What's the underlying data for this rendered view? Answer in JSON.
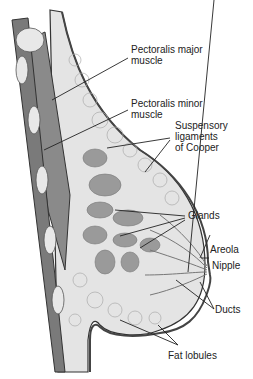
{
  "figure": {
    "colors": {
      "muscle": "#8a8a8a",
      "gland": "#9a9a9a",
      "fat": "#dcdcdc",
      "outline": "#333333",
      "skin": "#555555"
    },
    "labels": [
      {
        "id": "pectoralis-major",
        "lines": [
          "Pectoralis major",
          "muscle"
        ]
      },
      {
        "id": "pectoralis-minor",
        "lines": [
          "Pectoralis minor",
          "muscle"
        ]
      },
      {
        "id": "suspensory-ligaments",
        "lines": [
          "Suspensory",
          "ligaments",
          "of Cooper"
        ]
      },
      {
        "id": "glands",
        "lines": [
          "Glands"
        ]
      },
      {
        "id": "areola",
        "lines": [
          "Areola"
        ]
      },
      {
        "id": "nipple",
        "lines": [
          "Nipple"
        ]
      },
      {
        "id": "ducts",
        "lines": [
          "Ducts"
        ]
      },
      {
        "id": "fat-lobules",
        "lines": [
          "Fat lobules"
        ]
      }
    ]
  }
}
